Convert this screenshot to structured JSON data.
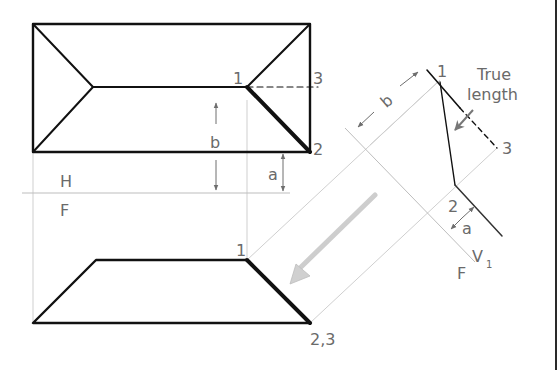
{
  "diagram": {
    "type": "descriptive-geometry",
    "colors": {
      "object_line": "#111111",
      "projector_line": "#c8c8c8",
      "fold_line": "#bdbdbd",
      "dimension_arrow": "#6e6e6e",
      "label_text": "#6a6a6a",
      "view_direction_arrow": "#d0d0d0"
    },
    "top_view": {
      "point_labels": {
        "p1": "1",
        "p2": "2",
        "p3": "3"
      },
      "dimension_b": "b",
      "dimension_a": "a"
    },
    "fold_line_hf": {
      "upper_label": "H",
      "lower_label": "F"
    },
    "front_view": {
      "point_labels": {
        "p1": "1",
        "p23": "2,3"
      }
    },
    "auxiliary_view": {
      "point_labels": {
        "p1": "1",
        "p2": "2",
        "p3": "3"
      },
      "dimension_b": "b",
      "dimension_a": "a",
      "annotation_line1": "True",
      "annotation_line2": "length",
      "fold_label_f": "F",
      "fold_label_v": "V",
      "fold_label_sub": "1"
    }
  }
}
